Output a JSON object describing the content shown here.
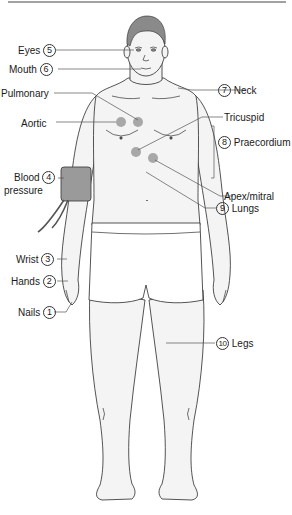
{
  "diagram": {
    "type": "anatomical-examination-checklist",
    "colors": {
      "outline": "#2a2a2a",
      "hair": "#8a8a8a",
      "cuff": "#9a9a9a",
      "auscultation_point": "#a8a8a8",
      "leader_line": "#555555",
      "skin": "#f4f4f4"
    },
    "labels": {
      "nails": {
        "num": "1",
        "text": "Nails"
      },
      "hands": {
        "num": "2",
        "text": "Hands"
      },
      "wrist": {
        "num": "3",
        "text": "Wrist"
      },
      "bp": {
        "num": "4",
        "text_line1": "Blood",
        "text_line2": "pressure"
      },
      "eyes": {
        "num": "5",
        "text": "Eyes"
      },
      "mouth": {
        "num": "6",
        "text": "Mouth"
      },
      "neck": {
        "num": "7",
        "text": "Neck"
      },
      "praecordium": {
        "num": "8",
        "text": "Praecordium"
      },
      "lungs": {
        "num": "9",
        "text": "Lungs"
      },
      "legs": {
        "num": "10",
        "text": "Legs"
      }
    },
    "auscultation_points": {
      "pulmonary": "Pulmonary",
      "aortic": "Aortic",
      "tricuspid": "Tricuspid",
      "apex": "Apex/mitral"
    }
  }
}
